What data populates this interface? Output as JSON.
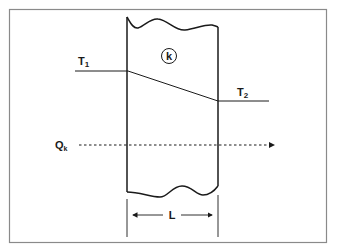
{
  "diagram": {
    "wall": {
      "conductivity_label": "k",
      "thickness_label": "L"
    },
    "temperatures": {
      "t1": {
        "main": "T",
        "sub": "1"
      },
      "t2": {
        "main": "T",
        "sub": "2"
      }
    },
    "heat_flow": {
      "main": "Q",
      "sub": "k"
    },
    "colors": {
      "line": "#1a1a1a",
      "frame": "#8a8a8a",
      "background": "#ffffff"
    }
  }
}
